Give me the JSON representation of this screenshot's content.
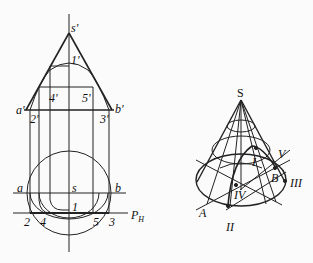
{
  "left_figure": {
    "title": "cone with section plane P_H (projections)",
    "labels": {
      "s_prime": "s'",
      "one_prime": "1'",
      "four_prime": "4'",
      "five_prime": "5'",
      "a_prime": "a'",
      "b_prime": "b'",
      "two_prime": "2'",
      "three_prime": "3'",
      "a": "a",
      "s": "s",
      "b": "b",
      "one": "1",
      "two": "2",
      "four": "4",
      "five": "5",
      "three": "3",
      "plane": "P",
      "plane_sub": "H"
    }
  },
  "right_figure": {
    "title": "cone axonometric view with section curve",
    "labels": {
      "S": "S",
      "I": "I",
      "V": "V",
      "B": "B",
      "III": "III",
      "IV": "IV",
      "A": "A",
      "II": "II"
    }
  }
}
